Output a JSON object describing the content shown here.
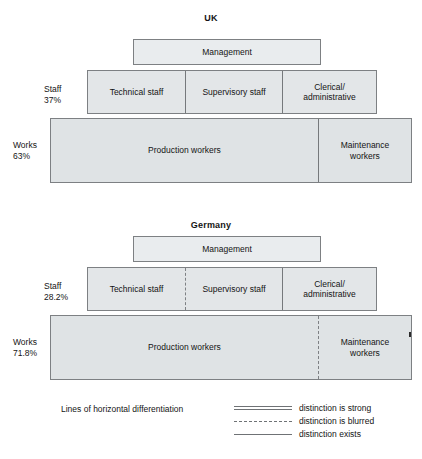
{
  "figure": {
    "caption": "Lines of horizontal differentiation"
  },
  "charts": [
    {
      "id": "uk",
      "title": "UK",
      "tiers": [
        {
          "id": "management",
          "side_label": "",
          "side_percent": "",
          "cells": [
            {
              "label": "Management",
              "divider": "none"
            }
          ]
        },
        {
          "id": "staff",
          "side_label": "Staff",
          "side_percent": "37%",
          "cells": [
            {
              "label": "Technical staff",
              "divider": "none"
            },
            {
              "label": "Supervisory staff",
              "divider": "solid"
            },
            {
              "label": "Clerical/\nadministrative",
              "divider": "solid"
            }
          ]
        },
        {
          "id": "works",
          "side_label": "Works",
          "side_percent": "63%",
          "cells": [
            {
              "label": "Production workers",
              "divider": "none"
            },
            {
              "label": "Maintenance\nworkers",
              "divider": "solid"
            }
          ]
        }
      ]
    },
    {
      "id": "germany",
      "title": "Germany",
      "tiers": [
        {
          "id": "management",
          "side_label": "",
          "side_percent": "",
          "cells": [
            {
              "label": "Management",
              "divider": "none"
            }
          ]
        },
        {
          "id": "staff",
          "side_label": "Staff",
          "side_percent": "28.2%",
          "cells": [
            {
              "label": "Technical staff",
              "divider": "none"
            },
            {
              "label": "Supervisory staff",
              "divider": "dashed"
            },
            {
              "label": "Clerical/\nadministrative",
              "divider": "solid"
            }
          ]
        },
        {
          "id": "works",
          "side_label": "Works",
          "side_percent": "71.8%",
          "cells": [
            {
              "label": "Production workers",
              "divider": "none"
            },
            {
              "label": "Maintenance\nworkers",
              "divider": "dashed"
            }
          ]
        }
      ]
    }
  ],
  "legend": {
    "entries": [
      {
        "style": "double",
        "label": "distinction is strong"
      },
      {
        "style": "dashed",
        "label": "distinction is blurred"
      },
      {
        "style": "single",
        "label": "distinction exists"
      }
    ]
  },
  "chart_data": {
    "type": "table",
    "categories": [
      "UK",
      "Germany"
    ],
    "series": [
      {
        "name": "Staff",
        "values": [
          37,
          28.2
        ]
      },
      {
        "name": "Works",
        "values": [
          63,
          71.8
        ]
      }
    ],
    "value_labels": [
      [
        "Staff 37%",
        "Works 63%"
      ],
      [
        "Staff 28.2%",
        "Works 71.8%"
      ]
    ],
    "levels": [
      "Management",
      "Staff",
      "Works"
    ],
    "groups": {
      "Management": [
        "Management"
      ],
      "Staff": [
        "Technical staff",
        "Supervisory staff",
        "Clerical/administrative"
      ],
      "Works": [
        "Production workers",
        "Maintenance workers"
      ]
    },
    "dividers": {
      "UK": {
        "technical_supervisory": "distinction is strong",
        "supervisory_clerical": "distinction is strong",
        "production_maintenance": "distinction is strong"
      },
      "Germany": {
        "technical_supervisory": "distinction is blurred",
        "supervisory_clerical": "distinction is strong",
        "production_maintenance": "distinction is blurred"
      }
    },
    "legend_entries": [
      "distinction is strong",
      "distinction is blurred",
      "distinction exists"
    ],
    "xlabel": "",
    "ylabel": "",
    "grid": false,
    "legend_position": "bottom-right"
  }
}
